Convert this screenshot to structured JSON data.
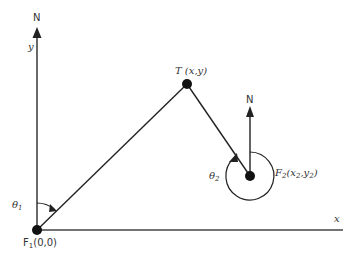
{
  "diagram": {
    "points": {
      "F1": {
        "label": "F",
        "sub": "1",
        "coords": "(0,0)"
      },
      "T": {
        "label": "T (x,y)"
      },
      "F2": {
        "label": "F",
        "sub": "2",
        "coords_open": "(x",
        "x_sub": "2",
        "sep": ",y",
        "y_sub": "2",
        "coords_close": ")"
      }
    },
    "axes": {
      "north_label_1": "N",
      "north_label_2": "N",
      "y_label": "y",
      "x_label": "x"
    },
    "angles": {
      "theta1": {
        "symbol": "θ",
        "sub": "1"
      },
      "theta2": {
        "symbol": "θ",
        "sub": "2"
      }
    },
    "colors": {
      "line": "#222222",
      "text": "#333333"
    }
  }
}
